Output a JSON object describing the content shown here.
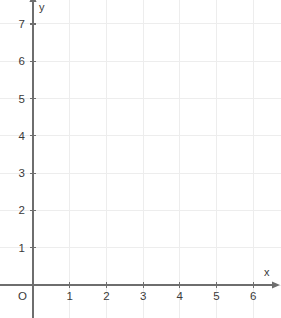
{
  "chart_data": {
    "type": "scatter",
    "title": "",
    "subtitle": "",
    "xlabel": "x",
    "ylabel": "y",
    "xlim": [
      0,
      6.5
    ],
    "ylim": [
      0,
      7.6
    ],
    "x_ticks": [
      1,
      2,
      3,
      4,
      5,
      6
    ],
    "y_ticks": [
      1,
      2,
      3,
      4,
      5,
      6,
      7
    ],
    "x_tick_labels": [
      "1",
      "2",
      "3",
      "4",
      "5",
      "6"
    ],
    "y_tick_labels": [
      "1",
      "2",
      "3",
      "4",
      "5",
      "6",
      "7"
    ],
    "origin_label": "O",
    "grid": true,
    "grid_step": 1,
    "legend": null,
    "series": [],
    "annotations": [],
    "data_points": []
  },
  "geometry": {
    "width": 281,
    "height": 318,
    "origin_x": 33,
    "origin_y": 285,
    "unit_x": 36.7,
    "unit_y": 37.3,
    "x_axis_end": 272,
    "y_axis_end": 2,
    "tick_overhang": 3
  },
  "colors": {
    "background": "#ffffff",
    "grid": "#ededed",
    "axis": "#6e6e6e",
    "text": "#3a3a3a"
  },
  "labels": {
    "x_axis_name": "x",
    "y_axis_name": "y",
    "origin": "O"
  }
}
